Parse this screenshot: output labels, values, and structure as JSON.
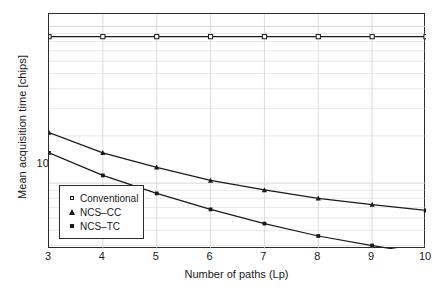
{
  "chart_data": {
    "type": "line",
    "title": "",
    "xlabel": "Number of paths (Lp)",
    "ylabel": "Mean acquisition time [chips]",
    "x": [
      3,
      4,
      5,
      6,
      7,
      8,
      9,
      10
    ],
    "xlim": [
      3,
      10
    ],
    "yscale": "log",
    "ylim": [
      380000,
      12000000
    ],
    "ytick_labels": [
      "10",
      "6"
    ],
    "ytick_values": [
      1000000
    ],
    "grid": true,
    "legend_position": "lower-left inside axes",
    "series": [
      {
        "name": "Conventional",
        "marker": "open-square",
        "values": [
          8600000,
          8600000,
          8600000,
          8600000,
          8600000,
          8600000,
          8600000,
          8600000
        ]
      },
      {
        "name": "NCS–CC",
        "marker": "filled-triangle",
        "values": [
          2100000,
          1560000,
          1260000,
          1040000,
          905000,
          800000,
          730000,
          670000
        ]
      },
      {
        "name": "NCS–TC",
        "marker": "filled-square",
        "values": [
          1560000,
          1120000,
          860000,
          680000,
          552000,
          460000,
          400000,
          352000
        ]
      }
    ]
  },
  "axes": {
    "x_ticks": [
      "3",
      "4",
      "5",
      "6",
      "7",
      "8",
      "9",
      "10"
    ],
    "y_major_tick_base": "10",
    "y_major_tick_exp": "6"
  },
  "legend": {
    "items": [
      {
        "label": "Conventional",
        "marker": "open-square-icon"
      },
      {
        "label": "NCS–CC",
        "marker": "filled-triangle-icon"
      },
      {
        "label": "NCS–TC",
        "marker": "filled-square-icon"
      }
    ]
  },
  "colors": {
    "line": "#1a1a1a",
    "frame": "#2b2b2b",
    "grid": "#d4d4d4",
    "background": "#ffffff"
  }
}
